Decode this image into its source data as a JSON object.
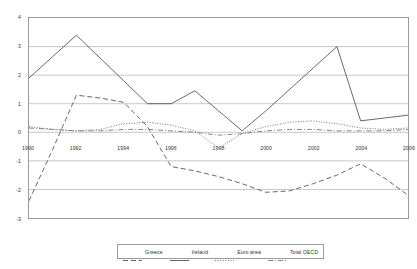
{
  "chart_data": {
    "type": "line",
    "title": "",
    "subtitle": "",
    "xlabel": "",
    "ylabel": "",
    "xlim": [
      1990,
      2006
    ],
    "ylim": [
      -3,
      4
    ],
    "grid": true,
    "grid_axis": "y",
    "legend_position": "bottom",
    "y_ticks": [
      4,
      3,
      2,
      1,
      0,
      -1,
      -2,
      -3
    ],
    "y_tick_labels": [
      "4",
      "3",
      "2",
      "1",
      "0",
      "-1",
      "-2",
      "-3"
    ],
    "x_ticks": [
      1990,
      1992,
      1994,
      1996,
      1998,
      2000,
      2002,
      2004,
      2006
    ],
    "x_tick_labels": [
      "1990",
      "1992",
      "1994",
      "1996",
      "1998",
      "2000",
      "2002",
      "2004",
      "2006"
    ],
    "x": [
      1990,
      1991,
      1992,
      1993,
      1994,
      1995,
      1996,
      1997,
      1998,
      1999,
      2000,
      2001,
      2002,
      2003,
      2004,
      2005,
      2006
    ],
    "series": [
      {
        "name": "Greece",
        "style": "dashed",
        "color": "#555555",
        "values": [
          -2.4,
          -0.6,
          1.3,
          1.2,
          1.05,
          0.2,
          -1.2,
          -1.35,
          -1.55,
          -1.8,
          -2.1,
          -2.05,
          -1.8,
          -1.5,
          -1.1,
          -1.6,
          -2.2
        ]
      },
      {
        "name": "Ireland",
        "style": "solid",
        "color": "#555555",
        "values": [
          1.9,
          2.65,
          3.4,
          2.6,
          1.8,
          1.0,
          1.0,
          1.45,
          0.75,
          0.05,
          0.75,
          1.5,
          2.25,
          3.0,
          0.4,
          0.5,
          0.6
        ]
      },
      {
        "name": "Euro area",
        "style": "dotted",
        "color": "#666666",
        "values": [
          0.2,
          0.1,
          0.05,
          0.1,
          0.3,
          0.35,
          0.25,
          0.05,
          -0.55,
          -0.05,
          0.2,
          0.35,
          0.4,
          0.3,
          0.15,
          0.1,
          0.15
        ]
      },
      {
        "name": "Total OECD",
        "style": "dashdot",
        "color": "#777777",
        "values": [
          0.15,
          0.1,
          0.05,
          0.05,
          0.1,
          0.1,
          0.05,
          0.0,
          -0.1,
          -0.05,
          0.05,
          0.1,
          0.1,
          0.05,
          0.05,
          0.05,
          0.1
        ]
      }
    ]
  },
  "legend": {
    "items": [
      {
        "label": "Greece"
      },
      {
        "label": "Ireland"
      },
      {
        "label": "Euro area"
      },
      {
        "label": "Total OECD"
      }
    ]
  }
}
